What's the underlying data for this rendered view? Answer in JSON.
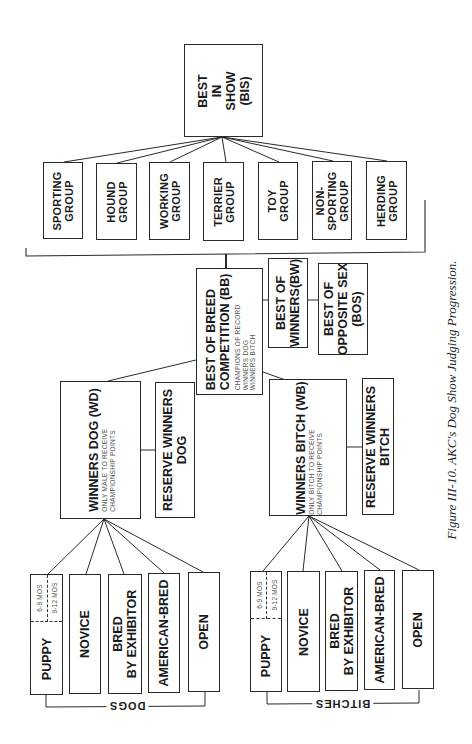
{
  "figure": {
    "caption": "Figure III-10. AKC's Dog Show Judging Progression."
  },
  "best_in_show": {
    "lines": [
      "BEST",
      "IN",
      "SHOW",
      "(BIS)"
    ]
  },
  "groups": [
    {
      "lines": [
        "SPORTING",
        "GROUP"
      ]
    },
    {
      "lines": [
        "HOUND",
        "GROUP"
      ]
    },
    {
      "lines": [
        "WORKING",
        "GROUP"
      ]
    },
    {
      "lines": [
        "TERRIER",
        "GROUP"
      ]
    },
    {
      "lines": [
        "TOY",
        "GROUP"
      ]
    },
    {
      "lines": [
        "NON-",
        "SPORTING",
        "GROUP"
      ]
    },
    {
      "lines": [
        "HERDING",
        "GROUP"
      ]
    }
  ],
  "best_of_breed": {
    "lines": [
      "BEST OF BREED",
      "COMPETITION (BB)"
    ],
    "sub_lines": [
      "CHAMPIONS OF RECORD",
      "WINNERS DOG",
      "WINNERS BITCH"
    ]
  },
  "best_of_winners": {
    "lines": [
      "BEST OF",
      "WINNERS(BW)"
    ]
  },
  "best_of_opposite_sex": {
    "lines": [
      "BEST OF",
      "OPPOSITE SEX",
      "(BOS)"
    ]
  },
  "winners_dog": {
    "title": "WINNERS DOG (WD)",
    "sub_lines": [
      "ONLY MALE TO RECEIVE",
      "CHAMPIONSHIP POINTS"
    ]
  },
  "reserve_winners_dog": {
    "lines": [
      "RESERVE WINNERS",
      "DOG"
    ]
  },
  "winners_bitch": {
    "title": "WINNERS BITCH (WB)",
    "sub_lines": [
      "ONLY BITCH TO RECEIVE",
      "CHAMPIONSHIP POINTS"
    ]
  },
  "reserve_winners_bitch": {
    "lines": [
      "RESERVE WINNERS",
      "BITCH"
    ]
  },
  "dog_classes": {
    "bracket_label": "DOGS",
    "puppy_subdivisions": [
      "6-9 MOS",
      "9-12 MOS"
    ],
    "classes": [
      {
        "lines": [
          "PUPPY"
        ]
      },
      {
        "lines": [
          "NOVICE"
        ]
      },
      {
        "lines": [
          "BRED",
          "BY EXHIBITOR"
        ]
      },
      {
        "lines": [
          "AMERICAN-BRED"
        ]
      },
      {
        "lines": [
          "OPEN"
        ]
      }
    ]
  },
  "bitch_classes": {
    "bracket_label": "BITCHES",
    "puppy_subdivisions": [
      "6-9 MOS",
      "9-12 MOS"
    ],
    "classes": [
      {
        "lines": [
          "PUPPY"
        ]
      },
      {
        "lines": [
          "NOVICE"
        ]
      },
      {
        "lines": [
          "BRED",
          "BY EXHIBITOR"
        ]
      },
      {
        "lines": [
          "AMERICAN-BRED"
        ]
      },
      {
        "lines": [
          "OPEN"
        ]
      }
    ]
  }
}
